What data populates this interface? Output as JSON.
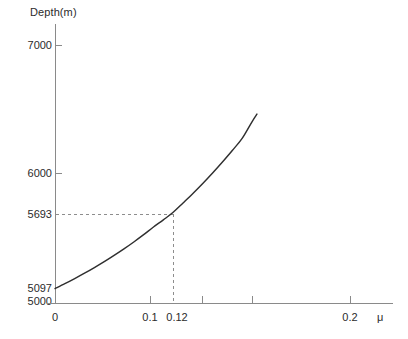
{
  "chart_data": {
    "type": "line",
    "title": "",
    "ylabel": "Depth(m)",
    "xlabel": "μ",
    "xlim": [
      0,
      0.33
    ],
    "ylim": [
      5000,
      7100
    ],
    "grid": false,
    "legend": "none",
    "y_ticks": [
      {
        "value": 7000,
        "label": "7000",
        "px": 45,
        "has_mark": true
      },
      {
        "value": 6000,
        "label": "6000",
        "px": 173,
        "has_mark": true
      },
      {
        "value": 5693,
        "label": "5693",
        "px": 214,
        "has_mark": true
      },
      {
        "value": 5097,
        "label": "5097",
        "px": 288,
        "has_mark": false
      },
      {
        "value": 5000,
        "label": "5000",
        "px": 301,
        "has_mark": false
      }
    ],
    "x_ticks": [
      {
        "value": 0,
        "label": "0",
        "px": 55,
        "has_mark": true
      },
      {
        "value": 0.1,
        "label": "0.1",
        "px": 150,
        "has_mark": true
      },
      {
        "value": 0.12,
        "label": "0.12",
        "px": 173,
        "has_mark": false
      },
      {
        "value": 0.15,
        "label": "",
        "px": 202,
        "has_mark": true
      },
      {
        "value": 0.2,
        "label": "0.2",
        "px": 252,
        "has_mark": true
      },
      {
        "value": 0.3,
        "label": "0.3",
        "px": 350,
        "has_mark": true
      }
    ],
    "series": [
      {
        "name": "depth-vs-mu",
        "x": [
          0.0,
          0.01,
          0.02,
          0.03,
          0.04,
          0.05,
          0.06,
          0.07,
          0.08,
          0.09,
          0.1,
          0.11,
          0.12,
          0.13,
          0.14,
          0.15,
          0.16,
          0.17,
          0.18,
          0.19,
          0.2,
          0.205
        ],
        "y": [
          5097,
          5135,
          5175,
          5217,
          5261,
          5307,
          5356,
          5407,
          5461,
          5518,
          5578,
          5634,
          5693,
          5766,
          5840,
          5918,
          6000,
          6086,
          6176,
          6270,
          6400,
          6460
        ]
      }
    ],
    "annotations": [
      {
        "name": "guide-point",
        "x": 0.12,
        "y": 5693,
        "h_guide_label": "5693",
        "v_guide_label": "0.12",
        "style": "dashed"
      }
    ],
    "colors": {
      "axis": "#808080",
      "curve": "#2b2b2b",
      "guide": "#909090",
      "text": "#2b2b2b",
      "background": "#ffffff"
    }
  }
}
